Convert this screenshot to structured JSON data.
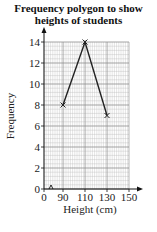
{
  "chart_data": {
    "type": "line",
    "title": "Frequency polygon to show heights of students",
    "title_lines": [
      "Frequency polygon to show",
      "heights of students"
    ],
    "xlabel": "Height (cm)",
    "ylabel": "Frequency",
    "x": [
      90,
      110,
      130
    ],
    "values": [
      8,
      14,
      7
    ],
    "series": [
      {
        "name": "Frequency",
        "x": [
          90,
          110,
          130
        ],
        "values": [
          8,
          14,
          7
        ]
      }
    ],
    "x_ticks": [
      "0",
      "90",
      "110",
      "130",
      "150"
    ],
    "y_ticks": [
      "0",
      "2",
      "4",
      "6",
      "8",
      "10",
      "12",
      "14"
    ],
    "xlim": [
      0,
      150
    ],
    "ylim": [
      0,
      14
    ],
    "axis_break": "x-axis between 0 and 90",
    "grid": true,
    "marker": "cross",
    "legend": "none"
  },
  "colors": {
    "line": "#222222",
    "grid": "#bbbbbb",
    "axis": "#111111"
  }
}
